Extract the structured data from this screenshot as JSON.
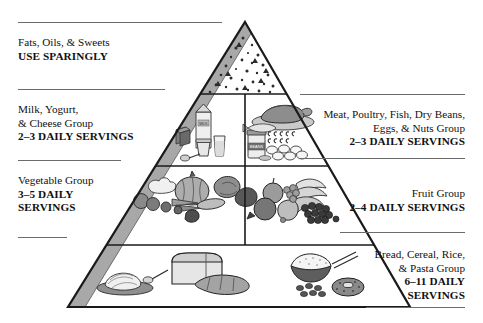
{
  "figure": {
    "name": "food-guide-pyramid",
    "background_color": "#ffffff",
    "outline_color": "#1a1a1a",
    "shade_color": "#a8a8a8",
    "rule_color": "#6b6b6b"
  },
  "tiers": [
    {
      "id": "tier-fats",
      "name": "Fats, Oils, & Sweets",
      "level": 1,
      "icons": [
        "fat-droplet-icon",
        "sugar-triangle-icon"
      ],
      "label": {
        "lines": [
          "Fats, Oils, & Sweets",
          "USE SPARINGLY"
        ],
        "bold": [
          false,
          true
        ],
        "side": "left"
      }
    },
    {
      "id": "tier-milk",
      "name": "Milk, Yogurt, & Cheese Group",
      "level": 2,
      "icons": [
        "milk-carton-icon",
        "cheese-block-icon",
        "yogurt-cup-icon",
        "milk-glass-icon",
        "spoon-icon"
      ],
      "label": {
        "lines": [
          "Milk, Yogurt,",
          "& Cheese Group",
          "2–3 DAILY SERVINGS"
        ],
        "bold": [
          false,
          false,
          true
        ],
        "side": "left"
      }
    },
    {
      "id": "tier-meat",
      "name": "Meat, Poultry, Fish, Dry Beans, Eggs, & Nuts Group",
      "level": 2,
      "icons": [
        "roast-poultry-icon",
        "beans-jar-icon",
        "fish-icon",
        "nuts-icon",
        "eggs-icon"
      ],
      "label": {
        "lines": [
          "Meat, Poultry, Fish, Dry Beans,",
          "Eggs, & Nuts Group",
          "2–3 DAILY SERVINGS"
        ],
        "bold": [
          false,
          false,
          true
        ],
        "side": "right"
      }
    },
    {
      "id": "tier-vegetable",
      "name": "Vegetable Group",
      "level": 3,
      "icons": [
        "pumpkin-icon",
        "broccoli-icon",
        "carrot-icon",
        "tomato-icon",
        "corn-icon",
        "leafy-green-icon"
      ],
      "label": {
        "lines": [
          "Vegetable Group",
          "3–5 DAILY",
          "SERVINGS"
        ],
        "bold": [
          false,
          true,
          true
        ],
        "side": "left"
      }
    },
    {
      "id": "tier-fruit",
      "name": "Fruit Group",
      "level": 3,
      "icons": [
        "banana-icon",
        "grapes-icon",
        "apple-icon",
        "pear-icon",
        "orange-icon"
      ],
      "label": {
        "lines": [
          "Fruit Group",
          "2–4 DAILY SERVINGS"
        ],
        "bold": [
          false,
          true
        ],
        "side": "right"
      }
    },
    {
      "id": "tier-bread",
      "name": "Bread, Cereal, Rice, & Pasta Group",
      "level": 4,
      "icons": [
        "pasta-plate-icon",
        "bread-loaf-icon",
        "baguette-icon",
        "rice-bowl-icon",
        "cereal-icon",
        "bagel-icon"
      ],
      "label": {
        "lines": [
          "Bread, Cereal, Rice,",
          "& Pasta Group",
          "6–11 DAILY",
          "SERVINGS"
        ],
        "bold": [
          false,
          false,
          true,
          true
        ],
        "side": "right"
      }
    }
  ],
  "labels": {
    "fats": {
      "l1": "Fats, Oils, & Sweets",
      "l2": "USE SPARINGLY"
    },
    "milk": {
      "l1": "Milk, Yogurt,",
      "l2": "& Cheese Group",
      "l3": "2–3 DAILY SERVINGS"
    },
    "meat": {
      "l1": "Meat, Poultry, Fish, Dry Beans,",
      "l2": "Eggs, & Nuts Group",
      "l3": "2–3 DAILY SERVINGS"
    },
    "vegetable": {
      "l1": "Vegetable Group",
      "l2": "3–5 DAILY",
      "l3": "SERVINGS"
    },
    "fruit": {
      "l1": "Fruit Group",
      "l2": "2–4 DAILY SERVINGS"
    },
    "bread": {
      "l1": "Bread, Cereal, Rice,",
      "l2": "& Pasta Group",
      "l3": "6–11 DAILY",
      "l4": "SERVINGS"
    }
  },
  "beans_jar_label": "BEANS",
  "milk_carton_label": "MILK"
}
